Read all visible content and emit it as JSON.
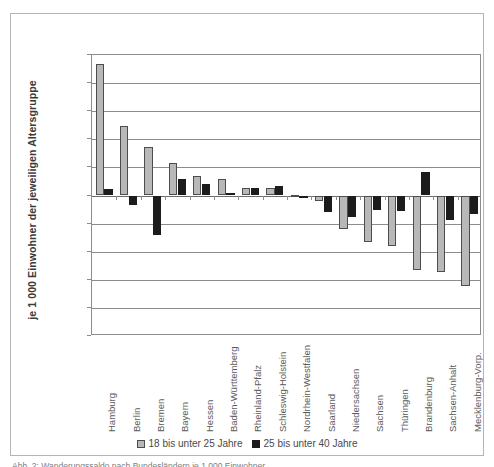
{
  "figure": {
    "caption": "Abb. 2: Wanderungssaldo nach Bundesländern je 1 000 Einwohner"
  },
  "chart_data": {
    "type": "bar",
    "title": "",
    "xlabel": "",
    "ylabel": "je 1 000 Einwohner der jeweiligen Altersgruppe",
    "ylim": [
      -50,
      50
    ],
    "yticks": [
      50,
      40,
      30,
      20,
      10,
      0,
      -10,
      -20,
      -30,
      -40,
      -50
    ],
    "grid": true,
    "legend_position": "bottom",
    "categories": [
      "Hamburg",
      "Berlin",
      "Bremen",
      "Bayern",
      "Hessen",
      "Baden-Württemberg",
      "Rheinland-Pfalz",
      "Schleswig-Holstein",
      "Nordrhein-Westfalen",
      "Saarland",
      "Niedersachsen",
      "Sachsen",
      "Thüringen",
      "Brandenburg",
      "Sachsen-Anhalt",
      "Mecklenburg-Vorp."
    ],
    "series": [
      {
        "name": "18 bis unter 25 Jahre",
        "color": "#b8b8b8",
        "values": [
          46.8,
          24.9,
          17.2,
          11.5,
          6.8,
          5.8,
          2.8,
          2.5,
          0.3,
          -1.8,
          -11.8,
          -16.7,
          -17.8,
          -26.6,
          -27.3,
          -32.2
        ]
      },
      {
        "name": "25 bis unter 40 Jahre",
        "color": "#1c1c1c",
        "values": [
          2.2,
          -3.5,
          -14.0,
          5.9,
          4.0,
          0.9,
          2.5,
          3.3,
          -1.0,
          -5.8,
          -7.6,
          -5.0,
          -5.5,
          8.2,
          -8.8,
          -6.5
        ]
      }
    ]
  },
  "legend": {
    "items": [
      {
        "label": "18 bis unter 25 Jahre",
        "swatch": "light-gray-square-icon"
      },
      {
        "label": "25 bis unter 40 Jahre",
        "swatch": "black-square-icon"
      }
    ]
  }
}
